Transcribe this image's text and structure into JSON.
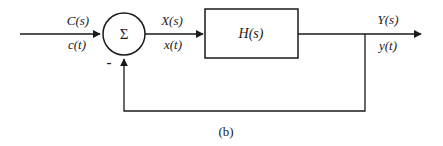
{
  "diagram": {
    "type": "feedback-control-block-diagram",
    "caption": "(b)",
    "junction": {
      "symbol": "Σ",
      "feedback_sign": "-"
    },
    "block": {
      "label": "H(s)"
    },
    "labels": {
      "input": {
        "s_domain": "C(s)",
        "t_domain": "c(t)"
      },
      "error": {
        "s_domain": "X(s)",
        "t_domain": "x(t)"
      },
      "output": {
        "s_domain": "Y(s)",
        "t_domain": "y(t)"
      }
    },
    "colors": {
      "line": "#1a1a1a",
      "background": "#ffffff"
    }
  }
}
